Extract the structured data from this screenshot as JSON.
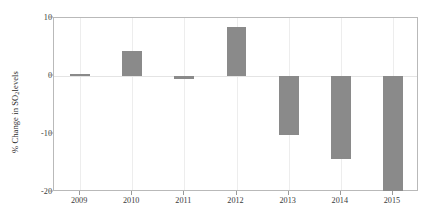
{
  "chart_data": {
    "type": "bar",
    "title": "",
    "xlabel": "",
    "ylabel": "% Change in SO2 levels",
    "ylabel_prefix": "% Change in SO",
    "ylabel_subscript": "2",
    "ylabel_suffix": " levels",
    "categories": [
      "2009",
      "2010",
      "2011",
      "2012",
      "2013",
      "2014",
      "2015"
    ],
    "values": [
      0,
      4.3,
      -0.5,
      8.5,
      -10.2,
      -14.3,
      -19.8
    ],
    "ylim": [
      -20,
      10
    ],
    "yticks": [
      10,
      0,
      -10,
      -20
    ],
    "ytick_labels": [
      "10",
      "0",
      "-10",
      "-20"
    ],
    "grid": "vertical-only",
    "legend": "none",
    "bar_color": "#8a8a8a",
    "frame_color": "#b9b9b9",
    "gridline_color": "#ededed",
    "background_color": "#ffffff"
  }
}
